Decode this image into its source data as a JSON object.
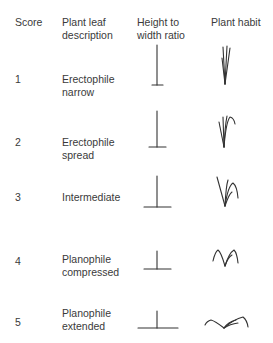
{
  "header": {
    "score": "Score",
    "description": "Plant leaf\ndescription",
    "ratio": "Height to\nwidth ratio",
    "habit": "Plant habit"
  },
  "rows": [
    {
      "score": "1",
      "description": "Erectophile\nnarrow",
      "ratio_icon": "tall-narrow-t-icon",
      "habit_icon": "erect-narrow-leaves-icon"
    },
    {
      "score": "2",
      "description": "Erectophile\nspread",
      "ratio_icon": "tall-t-icon",
      "habit_icon": "erect-spread-leaves-icon"
    },
    {
      "score": "3",
      "description": "Intermediate",
      "ratio_icon": "medium-t-icon",
      "habit_icon": "intermediate-leaves-icon"
    },
    {
      "score": "4",
      "description": "Planophile\ncompressed",
      "ratio_icon": "short-wide-t-icon",
      "habit_icon": "planophile-compressed-leaves-icon"
    },
    {
      "score": "5",
      "description": "Planophile\nextended",
      "ratio_icon": "short-widest-t-icon",
      "habit_icon": "planophile-extended-leaves-icon"
    }
  ],
  "colors": {
    "text": "#3a3a3a",
    "stroke": "#333333"
  }
}
